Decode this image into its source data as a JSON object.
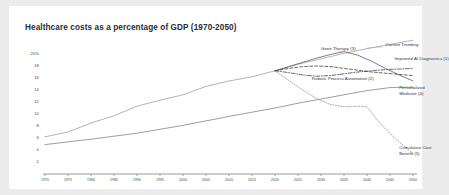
{
  "chart_data": {
    "type": "line",
    "title": "Healthcare costs as a percentage of GDP (1970-2050)",
    "xlabel": "",
    "ylabel": "",
    "grid": false,
    "legend_position": "inline-annotations",
    "xlim": [
      1970,
      2050
    ],
    "ylim": [
      0,
      21
    ],
    "yticks": [
      20,
      18,
      16,
      14,
      12,
      10,
      8,
      6,
      4,
      2
    ],
    "ytick_labels": [
      "20%",
      "18",
      "16",
      "14",
      "12",
      "10",
      "8",
      "6",
      "4",
      "2"
    ],
    "xticks": [
      1970,
      1975,
      1980,
      1985,
      1990,
      1995,
      2000,
      2005,
      2010,
      2015,
      2020,
      2025,
      2030,
      2035,
      2040,
      2045,
      2050
    ],
    "xtick_labels": [
      "1970",
      "1975",
      "1980",
      "1985",
      "1990",
      "1995",
      "2000",
      "2005",
      "2010",
      "2015",
      "2020",
      "2025",
      "2030",
      "2035",
      "2040",
      "2045",
      "2050"
    ],
    "series": [
      {
        "name": "Current Trending",
        "label": "Current Trending",
        "style": "solid",
        "color": "#9a9aa2",
        "x": [
          1970,
          1975,
          1980,
          1985,
          1990,
          1995,
          2000,
          2005,
          2010,
          2015,
          2020,
          2025,
          2030,
          2035,
          2040,
          2045,
          2050
        ],
        "y": [
          6.2,
          7.0,
          8.5,
          9.7,
          11.3,
          12.3,
          13.2,
          14.6,
          15.5,
          16.2,
          17.2,
          18.3,
          19.2,
          20.1,
          20.9,
          21.6,
          22.3
        ]
      },
      {
        "name": "Gene Therapy (3)",
        "label": "Gene Therapy (3)",
        "style": "solid",
        "color": "#55555d",
        "x": [
          2020,
          2023,
          2026,
          2029,
          2032,
          2035,
          2038,
          2041,
          2044,
          2047,
          2050
        ],
        "y": [
          17.2,
          17.9,
          18.6,
          19.3,
          19.9,
          20.4,
          19.8,
          18.8,
          17.6,
          16.5,
          15.5
        ]
      },
      {
        "name": "Improved AI Diagnostics (1)",
        "label": "Improved AI Diagnostics (1)",
        "style": "dashed",
        "color": "#3a3a42",
        "x": [
          2020,
          2023,
          2026,
          2029,
          2032,
          2035,
          2038,
          2041,
          2044,
          2047,
          2050
        ],
        "y": [
          17.2,
          17.6,
          17.9,
          18.0,
          17.9,
          17.6,
          17.3,
          17.0,
          16.8,
          16.6,
          16.4
        ]
      },
      {
        "name": "Robotic Process Automation (2)",
        "label": "Robotic Process Automation (2)",
        "style": "dash-dot",
        "color": "#3a3a42",
        "x": [
          2020,
          2023,
          2026,
          2029,
          2032,
          2035,
          2038,
          2041,
          2044,
          2047,
          2050
        ],
        "y": [
          17.2,
          16.9,
          16.5,
          16.3,
          16.4,
          16.7,
          17.0,
          17.2,
          17.4,
          17.5,
          17.6
        ]
      },
      {
        "name": "Personalized Medicine (4)",
        "label": "Personalized Medicine (4)",
        "style": "solid",
        "color": "#7c7c85",
        "x": [
          1970,
          1980,
          1990,
          2000,
          2010,
          2015,
          2020,
          2025,
          2030,
          2035,
          2040,
          2045,
          2050
        ],
        "y": [
          4.9,
          5.8,
          6.8,
          8.1,
          9.6,
          10.3,
          11.0,
          11.8,
          12.5,
          13.2,
          13.9,
          14.4,
          14.5
        ]
      },
      {
        "name": "Cumulative Cost Benefit (5)",
        "label": "Cumulative Cost Benefit (5)",
        "style": "dotted",
        "color": "#8a8a92",
        "x": [
          2020,
          2023,
          2026,
          2029,
          2032,
          2035,
          2038,
          2040,
          2043,
          2046,
          2050
        ],
        "y": [
          17.2,
          15.6,
          14.0,
          12.6,
          11.6,
          11.2,
          11.3,
          11.2,
          8.3,
          6.0,
          3.4
        ]
      }
    ],
    "annotations": [
      {
        "text": "Current Trending",
        "x": 2044,
        "y": 21.3
      },
      {
        "text": "Gene Therapy (3)",
        "x": 2030,
        "y": 20.6
      },
      {
        "text": "Improved AI Diagnostics (1)",
        "x": 2046,
        "y": 19.0
      },
      {
        "text": "Robotic Process Automation (2)",
        "x": 2028,
        "y": 15.7
      },
      {
        "text": "Personalized Medicine (4)",
        "x": 2047,
        "y": 14.2
      },
      {
        "text": "Cumulative Cost Benefit (5)",
        "x": 2047,
        "y": 4.2
      }
    ]
  }
}
